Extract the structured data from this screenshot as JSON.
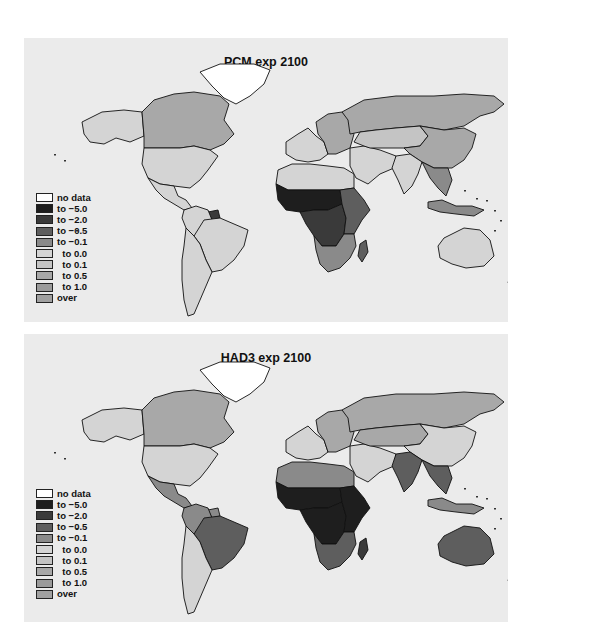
{
  "chart_data": [
    {
      "type": "choropleth-map",
      "title": "PCM exp 2100",
      "legend": {
        "position": "bottom-left",
        "entries": [
          {
            "label": "no data",
            "color": "#ffffff"
          },
          {
            "label": "to −5.0",
            "color": "#1e1e1e"
          },
          {
            "label": "to −2.0",
            "color": "#3a3a3a"
          },
          {
            "label": "to −0.5",
            "color": "#5e5e5e"
          },
          {
            "label": "to −0.1",
            "color": "#8a8a8a"
          },
          {
            "label": "  to 0.0",
            "color": "#d4d4d4"
          },
          {
            "label": "  to 0.1",
            "color": "#c4c4c4"
          },
          {
            "label": "  to 0.5",
            "color": "#a8a8a8"
          },
          {
            "label": "  to 1.0",
            "color": "#9a9a9a"
          },
          {
            "label": "over",
            "color": "#a0a0a0"
          }
        ]
      },
      "regions": [
        {
          "name": "Greenland",
          "class": "no data"
        },
        {
          "name": "Canada",
          "class": "to 0.5"
        },
        {
          "name": "Alaska",
          "class": "to 0.0"
        },
        {
          "name": "United States",
          "class": "to 0.0"
        },
        {
          "name": "Mexico & Central America",
          "class": "to 0.0"
        },
        {
          "name": "South America",
          "class": "to 0.0"
        },
        {
          "name": "Guyana/Suriname",
          "class": "to -2.0"
        },
        {
          "name": "Western Europe",
          "class": "to 0.0"
        },
        {
          "name": "Eastern Europe",
          "class": "to 0.5"
        },
        {
          "name": "Russia",
          "class": "to 0.5"
        },
        {
          "name": "North Africa",
          "class": "to 0.0"
        },
        {
          "name": "Sahel & West Africa",
          "class": "to -5.0"
        },
        {
          "name": "Central Africa",
          "class": "to -2.0"
        },
        {
          "name": "East Africa",
          "class": "to -0.5"
        },
        {
          "name": "Southern Africa",
          "class": "to -0.1"
        },
        {
          "name": "Madagascar",
          "class": "to -0.5"
        },
        {
          "name": "Middle East",
          "class": "to 0.0"
        },
        {
          "name": "Central Asia",
          "class": "to 0.1"
        },
        {
          "name": "China",
          "class": "to 0.5"
        },
        {
          "name": "India",
          "class": "to 0.0"
        },
        {
          "name": "Southeast Asia",
          "class": "to -0.1"
        },
        {
          "name": "Indonesia",
          "class": "to -0.1"
        },
        {
          "name": "Australia",
          "class": "to 0.0"
        },
        {
          "name": "New Zealand",
          "class": "to 0.0"
        }
      ]
    },
    {
      "type": "choropleth-map",
      "title": "HAD3 exp 2100",
      "legend": {
        "position": "bottom-left",
        "entries": [
          {
            "label": "no data",
            "color": "#ffffff"
          },
          {
            "label": "to −5.0",
            "color": "#1e1e1e"
          },
          {
            "label": "to −2.0",
            "color": "#3a3a3a"
          },
          {
            "label": "to −0.5",
            "color": "#5e5e5e"
          },
          {
            "label": "to −0.1",
            "color": "#8a8a8a"
          },
          {
            "label": "  to 0.0",
            "color": "#d4d4d4"
          },
          {
            "label": "  to 0.1",
            "color": "#c4c4c4"
          },
          {
            "label": "  to 0.5",
            "color": "#a8a8a8"
          },
          {
            "label": "  to 1.0",
            "color": "#9a9a9a"
          },
          {
            "label": "over",
            "color": "#a0a0a0"
          }
        ]
      },
      "regions": [
        {
          "name": "Greenland",
          "class": "no data"
        },
        {
          "name": "Canada",
          "class": "to 0.5"
        },
        {
          "name": "Alaska",
          "class": "to 0.0"
        },
        {
          "name": "United States",
          "class": "to 0.0"
        },
        {
          "name": "Mexico & Central America",
          "class": "to -0.1"
        },
        {
          "name": "Brazil",
          "class": "to -0.5"
        },
        {
          "name": "Northern South America",
          "class": "to -0.1"
        },
        {
          "name": "Southern South America",
          "class": "to 0.0"
        },
        {
          "name": "Western Europe",
          "class": "to 0.0"
        },
        {
          "name": "Eastern Europe",
          "class": "to 0.5"
        },
        {
          "name": "Russia",
          "class": "to 0.5"
        },
        {
          "name": "North Africa",
          "class": "to -0.1"
        },
        {
          "name": "Sub-Saharan Africa",
          "class": "to -5.0"
        },
        {
          "name": "Southern Africa",
          "class": "to -0.5"
        },
        {
          "name": "Madagascar",
          "class": "to -2.0"
        },
        {
          "name": "Middle East",
          "class": "to 0.0"
        },
        {
          "name": "Central Asia",
          "class": "to 0.5"
        },
        {
          "name": "China",
          "class": "to 0.0"
        },
        {
          "name": "India",
          "class": "to -0.5"
        },
        {
          "name": "Southeast Asia",
          "class": "to -0.5"
        },
        {
          "name": "Indonesia",
          "class": "to -0.1"
        },
        {
          "name": "Australia",
          "class": "to -0.5"
        },
        {
          "name": "New Zealand",
          "class": "to 0.0"
        }
      ]
    }
  ],
  "panels": {
    "top": {
      "title": "PCM exp 2100",
      "fills": {
        "greenland": "#ffffff",
        "canada": "#a8a8a8",
        "alaska": "#d4d4d4",
        "usa": "#d4d4d4",
        "central_america": "#d4d4d4",
        "south_america_north": "#d4d4d4",
        "brazil": "#d4d4d4",
        "south_america_south": "#d4d4d4",
        "guyana": "#3a3a3a",
        "europe_west": "#d4d4d4",
        "europe_east": "#a8a8a8",
        "russia": "#a8a8a8",
        "north_africa": "#d4d4d4",
        "sahel": "#1e1e1e",
        "central_africa": "#3a3a3a",
        "east_africa": "#5e5e5e",
        "southern_africa": "#8a8a8a",
        "madagascar": "#5e5e5e",
        "middle_east": "#d4d4d4",
        "central_asia": "#c4c4c4",
        "china": "#a8a8a8",
        "india": "#d4d4d4",
        "se_asia": "#8a8a8a",
        "indonesia": "#8a8a8a",
        "australia": "#d4d4d4",
        "new_zealand": "#d4d4d4"
      }
    },
    "bottom": {
      "title": "HAD3 exp 2100",
      "fills": {
        "greenland": "#ffffff",
        "canada": "#a8a8a8",
        "alaska": "#d4d4d4",
        "usa": "#d4d4d4",
        "central_america": "#8a8a8a",
        "south_america_north": "#8a8a8a",
        "brazil": "#5e5e5e",
        "south_america_south": "#d4d4d4",
        "guyana": "#8a8a8a",
        "europe_west": "#d4d4d4",
        "europe_east": "#a8a8a8",
        "russia": "#a8a8a8",
        "north_africa": "#8a8a8a",
        "sahel": "#1e1e1e",
        "central_africa": "#1e1e1e",
        "east_africa": "#1e1e1e",
        "southern_africa": "#5e5e5e",
        "madagascar": "#3a3a3a",
        "middle_east": "#d4d4d4",
        "central_asia": "#a8a8a8",
        "china": "#d4d4d4",
        "india": "#5e5e5e",
        "se_asia": "#5e5e5e",
        "indonesia": "#8a8a8a",
        "australia": "#5e5e5e",
        "new_zealand": "#d4d4d4"
      }
    }
  },
  "legend": {
    "entries": [
      {
        "label": "no data",
        "color": "#ffffff"
      },
      {
        "label": "to −5.0",
        "color": "#1e1e1e"
      },
      {
        "label": "to −2.0",
        "color": "#3a3a3a"
      },
      {
        "label": "to −0.5",
        "color": "#5e5e5e"
      },
      {
        "label": "to −0.1",
        "color": "#8a8a8a"
      },
      {
        "label": "  to 0.0",
        "color": "#d4d4d4"
      },
      {
        "label": "  to 0.1",
        "color": "#c4c4c4"
      },
      {
        "label": "  to 0.5",
        "color": "#a8a8a8"
      },
      {
        "label": "  to 1.0",
        "color": "#9a9a9a"
      },
      {
        "label": "over",
        "color": "#a0a0a0"
      }
    ]
  },
  "colors": {
    "panel_bg": "#ebebeb",
    "border": "#111111"
  }
}
